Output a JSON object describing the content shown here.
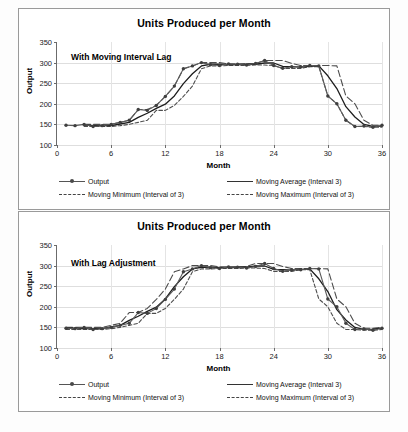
{
  "page": {
    "background": "#fdfdfd",
    "border_color": "#9a9a9a"
  },
  "charts": [
    {
      "id": "chart-top",
      "title": "Units Produced per Month",
      "annotation": "With Moving  Interval  Lag",
      "xlabel": "Month",
      "ylabel": "Output"
    },
    {
      "id": "chart-bottom",
      "title": "Units Produced per Month",
      "annotation": "With Lag Adjustment",
      "xlabel": "Month",
      "ylabel": "Output"
    }
  ],
  "axes": {
    "y_ticks": [
      "350",
      "300",
      "250",
      "200",
      "150",
      "100"
    ],
    "x_ticks": [
      "0",
      "6",
      "12",
      "18",
      "24",
      "30",
      "36"
    ]
  },
  "legend": {
    "output": "Output",
    "moving_average": "Moving Average (Interval 3)",
    "moving_minimum": "Moving Minimum (Interval of 3)",
    "moving_maximum": "Moving Maximum (Interval of 3)"
  },
  "chart_data": [
    {
      "type": "line",
      "title": "Units Produced per Month",
      "subtitle": "With Moving  Interval  Lag",
      "xlabel": "Month",
      "ylabel": "Output",
      "xlim": [
        0,
        36
      ],
      "ylim": [
        100,
        350
      ],
      "ytick_step": 50,
      "xtick_step": 6,
      "grid": true,
      "legend_position": "bottom",
      "x": [
        1,
        2,
        3,
        4,
        5,
        6,
        7,
        8,
        9,
        10,
        11,
        12,
        13,
        14,
        15,
        16,
        17,
        18,
        19,
        20,
        21,
        22,
        23,
        24,
        25,
        26,
        27,
        28,
        29,
        30,
        31,
        32,
        33,
        34,
        35,
        36
      ],
      "series": [
        {
          "name": "Output",
          "style": "solid-with-markers",
          "values": [
            148,
            147,
            150,
            145,
            147,
            150,
            155,
            160,
            186,
            184,
            196,
            218,
            243,
            285,
            292,
            300,
            295,
            293,
            297,
            296,
            294,
            298,
            305,
            293,
            286,
            290,
            290,
            293,
            292,
            219,
            200,
            160,
            145,
            146,
            143,
            148
          ]
        },
        {
          "name": "Moving Average (Interval 3)",
          "style": "solid",
          "values": [
            null,
            null,
            148,
            147,
            147,
            147,
            151,
            155,
            167,
            177,
            189,
            199,
            219,
            249,
            273,
            292,
            296,
            296,
            295,
            295,
            296,
            296,
            299,
            299,
            291,
            290,
            289,
            291,
            292,
            268,
            237,
            193,
            168,
            150,
            145,
            146
          ]
        },
        {
          "name": "Moving Minimum (Interval of 3)",
          "style": "dashed-fine",
          "values": [
            null,
            null,
            145,
            145,
            145,
            145,
            147,
            150,
            155,
            160,
            184,
            184,
            196,
            218,
            243,
            285,
            292,
            292,
            293,
            293,
            293,
            294,
            294,
            293,
            286,
            286,
            286,
            290,
            290,
            219,
            200,
            160,
            145,
            145,
            143,
            143
          ]
        },
        {
          "name": "Moving Maximum (Interval of 3)",
          "style": "dashed-wide",
          "values": [
            null,
            null,
            150,
            150,
            150,
            150,
            155,
            160,
            186,
            186,
            196,
            218,
            243,
            285,
            292,
            300,
            300,
            300,
            297,
            297,
            297,
            298,
            305,
            305,
            305,
            298,
            293,
            293,
            293,
            293,
            292,
            219,
            200,
            160,
            148,
            148
          ]
        }
      ]
    },
    {
      "type": "line",
      "title": "Units Produced per Month",
      "subtitle": "With Lag Adjustment",
      "xlabel": "Month",
      "ylabel": "Output",
      "xlim": [
        0,
        36
      ],
      "ylim": [
        100,
        350
      ],
      "ytick_step": 50,
      "xtick_step": 6,
      "grid": true,
      "legend_position": "bottom",
      "x": [
        1,
        2,
        3,
        4,
        5,
        6,
        7,
        8,
        9,
        10,
        11,
        12,
        13,
        14,
        15,
        16,
        17,
        18,
        19,
        20,
        21,
        22,
        23,
        24,
        25,
        26,
        27,
        28,
        29,
        30,
        31,
        32,
        33,
        34,
        35,
        36
      ],
      "series": [
        {
          "name": "Output",
          "style": "solid-with-markers",
          "values": [
            148,
            147,
            150,
            145,
            147,
            150,
            155,
            160,
            186,
            184,
            196,
            218,
            243,
            285,
            292,
            300,
            295,
            293,
            297,
            296,
            294,
            298,
            305,
            293,
            286,
            290,
            290,
            293,
            292,
            219,
            200,
            160,
            145,
            146,
            143,
            148
          ]
        },
        {
          "name": "Moving Average (Interval 3)",
          "style": "solid",
          "values": [
            148,
            148,
            147,
            147,
            147,
            151,
            155,
            167,
            177,
            189,
            199,
            219,
            249,
            273,
            292,
            296,
            296,
            295,
            295,
            296,
            296,
            299,
            299,
            291,
            290,
            289,
            291,
            292,
            268,
            237,
            193,
            168,
            150,
            145,
            146,
            148
          ]
        },
        {
          "name": "Moving Minimum (Interval of 3)",
          "style": "dashed-fine",
          "values": [
            145,
            145,
            145,
            145,
            145,
            147,
            150,
            155,
            160,
            184,
            184,
            196,
            218,
            243,
            285,
            292,
            292,
            293,
            293,
            293,
            294,
            294,
            293,
            286,
            286,
            286,
            290,
            290,
            219,
            200,
            160,
            145,
            145,
            143,
            143,
            145
          ]
        },
        {
          "name": "Moving Maximum (Interval of 3)",
          "style": "dashed-wide",
          "values": [
            150,
            150,
            150,
            150,
            150,
            155,
            160,
            186,
            186,
            196,
            218,
            243,
            285,
            292,
            300,
            300,
            300,
            297,
            297,
            297,
            298,
            305,
            305,
            305,
            298,
            293,
            293,
            293,
            293,
            292,
            219,
            200,
            160,
            148,
            148,
            150
          ]
        }
      ]
    }
  ]
}
